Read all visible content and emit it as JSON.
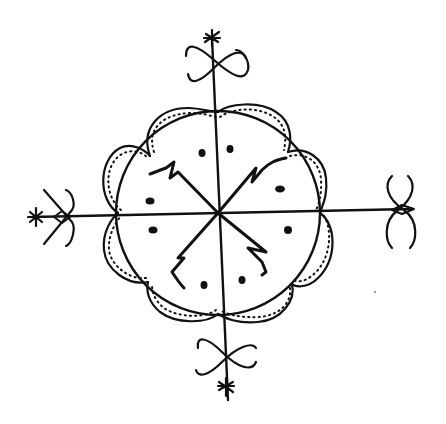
{
  "image": {
    "description": "Hand-drawn black ink veve-style symbol on white background",
    "background_color": "#ffffff",
    "ink_color": "#111111",
    "center": [
      218,
      213
    ],
    "circle_radius": 103,
    "scallop_count": 8,
    "dots_count": 8,
    "arms": [
      "top",
      "right",
      "bottom",
      "left"
    ],
    "arm_ornament": "figure-eight loops with star terminal"
  }
}
